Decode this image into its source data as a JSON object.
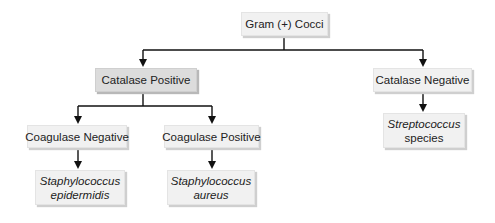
{
  "diagram": {
    "type": "flowchart",
    "root": {
      "label": "Gram (+) Cocci"
    },
    "level1": {
      "catalase_positive": {
        "label": "Catalase Positive"
      },
      "catalase_negative": {
        "label": "Catalase Negative"
      }
    },
    "level2": {
      "coagulase_negative": {
        "label": "Coagulase Negative"
      },
      "coagulase_positive": {
        "label": "Coagulase Positive"
      },
      "streptococcus": {
        "line1": "Streptococcus",
        "line2": "species"
      }
    },
    "level3": {
      "staph_epidermidis": {
        "line1": "Staphylococcus",
        "line2": "epidermidis"
      },
      "staph_aureus": {
        "line1": "Staphylococcus",
        "line2": "aureus"
      }
    },
    "colors": {
      "box_fill": "#f1f1f1",
      "box_fill_highlight": "#dcdcdc",
      "line": "#111111"
    },
    "edges": [
      {
        "from": "Gram (+) Cocci",
        "to": "Catalase Positive"
      },
      {
        "from": "Gram (+) Cocci",
        "to": "Catalase Negative"
      },
      {
        "from": "Catalase Positive",
        "to": "Coagulase Negative"
      },
      {
        "from": "Catalase Positive",
        "to": "Coagulase Positive"
      },
      {
        "from": "Catalase Negative",
        "to": "Streptococcus species"
      },
      {
        "from": "Coagulase Negative",
        "to": "Staphylococcus epidermidis"
      },
      {
        "from": "Coagulase Positive",
        "to": "Staphylococcus aureus"
      }
    ]
  }
}
